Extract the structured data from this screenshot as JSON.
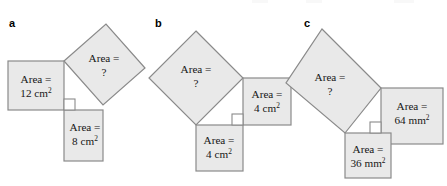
{
  "figure": {
    "title_visible": false,
    "background_color": "#ffffff",
    "shape_fill": "#e9e9e9",
    "shape_stroke": "#8a8a8a",
    "text_color": "#161616",
    "panels": [
      {
        "letter": "a",
        "squares": [
          {
            "role": "leg-square-left",
            "line1": "Area =",
            "line2_value": "12",
            "line2_unit": "cm",
            "line2_exponent": "2",
            "orientation": "axis-aligned"
          },
          {
            "role": "hypotenuse-square",
            "line1": "Area =",
            "line2_value": "?",
            "line2_unit": "",
            "line2_exponent": "",
            "orientation": "tilted"
          },
          {
            "role": "leg-square-bottom",
            "line1": "Area =",
            "line2_value": "8",
            "line2_unit": "cm",
            "line2_exponent": "2",
            "orientation": "axis-aligned"
          }
        ],
        "right_angle_marker": true
      },
      {
        "letter": "b",
        "squares": [
          {
            "role": "hypotenuse-square",
            "line1": "Area =",
            "line2_value": "?",
            "line2_unit": "",
            "line2_exponent": "",
            "orientation": "tilted"
          },
          {
            "role": "leg-square-right",
            "line1": "Area =",
            "line2_value": "4",
            "line2_unit": "cm",
            "line2_exponent": "2",
            "orientation": "axis-aligned"
          },
          {
            "role": "leg-square-bottom",
            "line1": "Area =",
            "line2_value": "4",
            "line2_unit": "cm",
            "line2_exponent": "2",
            "orientation": "axis-aligned"
          }
        ],
        "right_angle_marker": true
      },
      {
        "letter": "c",
        "squares": [
          {
            "role": "hypotenuse-square",
            "line1": "Area =",
            "line2_value": "?",
            "line2_unit": "",
            "line2_exponent": "",
            "orientation": "tilted"
          },
          {
            "role": "leg-square-right",
            "line1": "Area =",
            "line2_value": "64",
            "line2_unit": "mm",
            "line2_exponent": "2",
            "orientation": "axis-aligned"
          },
          {
            "role": "leg-square-bottom",
            "line1": "Area =",
            "line2_value": "36",
            "line2_unit": "mm",
            "line2_exponent": "2",
            "orientation": "axis-aligned"
          }
        ],
        "right_angle_marker": true
      }
    ]
  }
}
